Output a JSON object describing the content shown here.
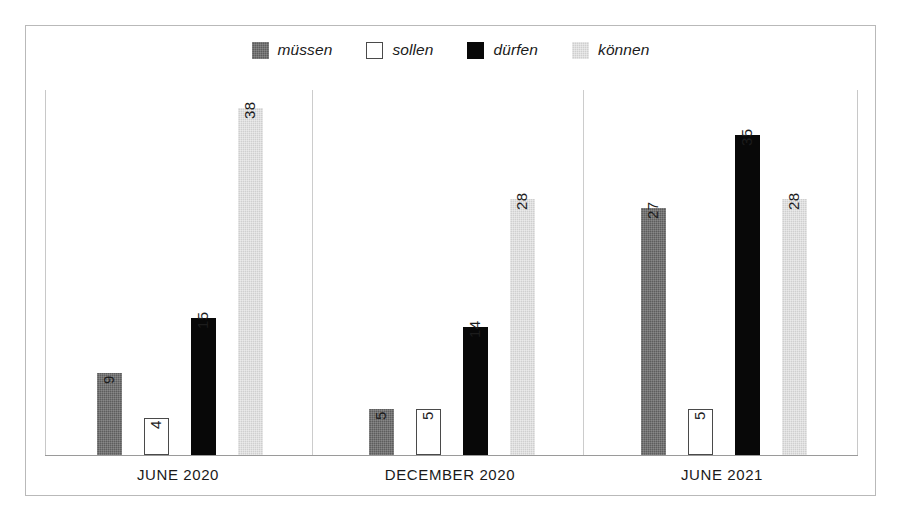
{
  "chart_data": {
    "type": "bar",
    "title": "",
    "subtitle": "",
    "xlabel": "",
    "ylabel": "",
    "grid": false,
    "legend_position": "top-center",
    "ylim": [
      0,
      40
    ],
    "axis_visible_ticks": false,
    "categories": [
      "JUNE 2020",
      "DECEMBER 2020",
      "JUNE 2021"
    ],
    "series": [
      {
        "name": "müssen",
        "color": "#5d5d5d",
        "values": [
          9,
          5,
          27
        ]
      },
      {
        "name": "sollen",
        "color": "#ffffff",
        "border_color": "#4a4a4a",
        "values": [
          4,
          5,
          5
        ]
      },
      {
        "name": "dürfen",
        "color": "#080808",
        "values": [
          15,
          14,
          35
        ]
      },
      {
        "name": "können",
        "color": "#cfcfcf",
        "values": [
          38,
          28,
          28
        ]
      }
    ],
    "value_labels": [
      [
        "9",
        "4",
        "15",
        "38"
      ],
      [
        "5",
        "5",
        "14",
        "28"
      ],
      [
        "27",
        "5",
        "35",
        "28"
      ]
    ]
  },
  "legend": {
    "items": [
      {
        "label": "müssen",
        "swatch": "mussen"
      },
      {
        "label": "sollen",
        "swatch": "sollen"
      },
      {
        "label": "dürfen",
        "swatch": "durfen"
      },
      {
        "label": "können",
        "swatch": "konnen"
      }
    ]
  },
  "axis": {
    "categories": [
      {
        "label": "JUNE 2020"
      },
      {
        "label": "DECEMBER 2020"
      },
      {
        "label": "JUNE 2021"
      }
    ]
  },
  "colors": {
    "frame": "#b9b9b9",
    "baseline": "#9a9a9a",
    "separator": "#cccccc",
    "text": "#1a1a1a"
  }
}
